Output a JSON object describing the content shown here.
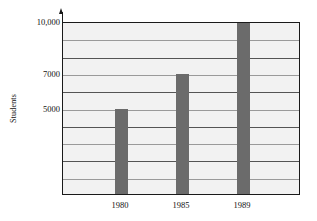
{
  "chart_data": {
    "type": "bar",
    "title": "",
    "xlabel": "",
    "ylabel": "Students",
    "categories": [
      "1980",
      "1985",
      "1989"
    ],
    "values": [
      5000,
      7000,
      10000
    ],
    "ylim": [
      0,
      10000
    ],
    "y_ticks_labeled": [
      "10,000",
      "7000",
      "5000"
    ],
    "y_ticks_labeled_values": [
      10000,
      7000,
      5000
    ],
    "gridlines": true,
    "grid_step": 1000,
    "legend": "none",
    "series": [
      {
        "name": "Students",
        "values": [
          5000,
          7000,
          10000
        ]
      }
    ]
  },
  "axis": {
    "y_label": "Students",
    "tick_10000": "10,000",
    "tick_7000": "7000",
    "tick_5000": "5000"
  },
  "x_labels": {
    "t0": "1980",
    "t1": "1985",
    "t2": "1989"
  },
  "colors": {
    "bar": "#6b6b6b",
    "plot_background": "#f2f2f2",
    "axis": "#1a1a1a",
    "gridline_major": "#555555",
    "gridline_minor": "#9a9a9a"
  }
}
